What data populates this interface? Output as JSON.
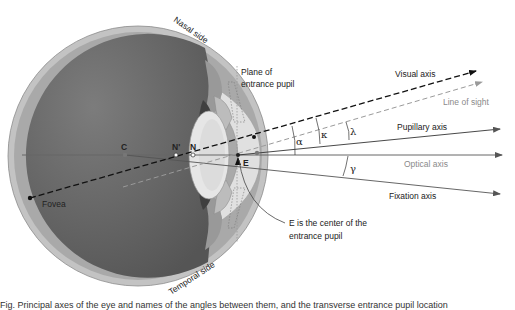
{
  "diagram": {
    "colors": {
      "sclera": "#bdbdbd",
      "vitreous": "#6e6e6e",
      "lens": "#e4e4e4",
      "iris": "#4a4a4a",
      "ciliary": "#a8a8a8",
      "axis_dark": "#111111",
      "axis_solid": "#555555",
      "line_of_sight": "#9a9a9a"
    },
    "side_labels": {
      "nasal": "Nasal side",
      "temporal": "Temporal side"
    },
    "points": {
      "center": "C",
      "nodal_rear": "N'",
      "nodal_front": "N",
      "pupil_center": "E",
      "fovea": "Fovea"
    },
    "plane_label": {
      "line1": "Plane of",
      "line2": "entrance pupil"
    },
    "axes": {
      "visual": "Visual axis",
      "line_of_sight": "Line of sight",
      "pupillary": "Pupillary axis",
      "optical": "Optical axis",
      "fixation": "Fixation axis"
    },
    "angles": {
      "alpha": "α",
      "kappa": "κ",
      "lambda": "λ",
      "gamma": "γ"
    },
    "annotation": {
      "line1": "E is the center of the",
      "line2": "entrance pupil"
    }
  },
  "caption": "Fig. Principal axes of the eye and names of the angles between them, and the transverse entrance pupil location"
}
